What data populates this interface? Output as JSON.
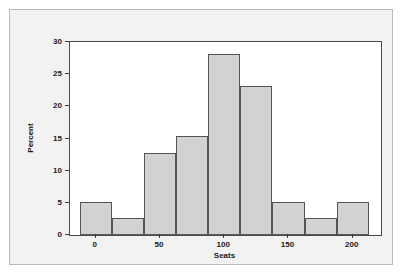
{
  "figure": {
    "background_color": "#f2f2f2",
    "border_color": "#b9b9b9",
    "plot_background": "#ffffff",
    "frame_color": "#4a4a4a"
  },
  "chart_data": {
    "type": "bar",
    "title": "",
    "subtitle": "",
    "xlabel": "Seats",
    "ylabel": "Percent",
    "xlim": [
      -20,
      222
    ],
    "ylim": [
      0,
      30
    ],
    "grid": false,
    "legend": null,
    "bar_fill_color": "#d2d2d2",
    "bar_edge_color": "#555555",
    "bin_width": 25,
    "x_ticks": [
      0,
      50,
      100,
      150,
      200
    ],
    "x_tick_labels": [
      "0",
      "50",
      "100",
      "150",
      "200"
    ],
    "y_ticks": [
      0,
      5,
      10,
      15,
      20,
      25,
      30
    ],
    "y_tick_labels": [
      "0",
      "5",
      "10",
      "15",
      "20",
      "25",
      "30"
    ],
    "bin_edges": [
      -12.5,
      12.5,
      37.5,
      62.5,
      87.5,
      112.5,
      137.5,
      162.5,
      187.5,
      212.5
    ],
    "categories": [
      "-12.5 to 12.5",
      "12.5 to 37.5",
      "37.5 to 62.5",
      "62.5 to 87.5",
      "87.5 to 112.5",
      "112.5 to 137.5",
      "137.5 to 162.5",
      "162.5 to 187.5",
      "187.5 to 212.5"
    ],
    "values": [
      5.1,
      2.7,
      12.7,
      15.4,
      28.2,
      23.1,
      5.1,
      2.7,
      5.1
    ],
    "bin_centers": [
      0,
      25,
      50,
      75,
      100,
      125,
      150,
      175,
      200
    ]
  }
}
